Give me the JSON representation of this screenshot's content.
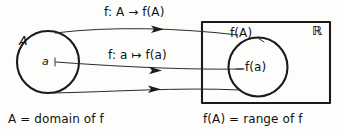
{
  "figure": {
    "background_color": "#fdfdfc",
    "ink_color": "#1a1a1a"
  },
  "domain_set": {
    "label": "A",
    "element_label": "a"
  },
  "codomain_box": {
    "ambient_label": "ℝ"
  },
  "range_set": {
    "label": "f(A)",
    "element_label": "f(a)"
  },
  "arrow_labels": {
    "set_map": "f: A → f(A)",
    "element_map": "f: a ↦ f(a)"
  },
  "captions": {
    "left": "A = domain of f",
    "right": "f(A) = range of f"
  }
}
